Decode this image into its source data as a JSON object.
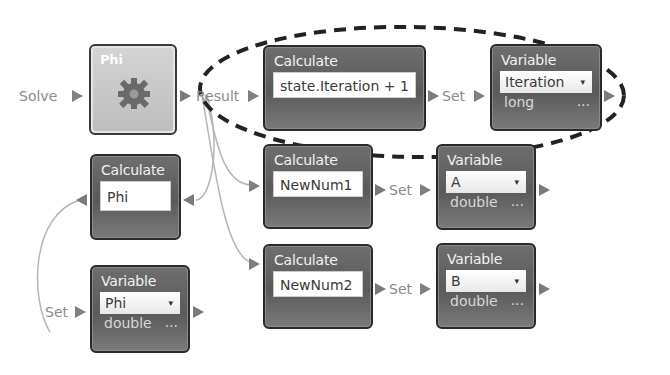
{
  "colors": {
    "node_bg": "#626262",
    "node_border": "#2a2a2a",
    "phi_bg": "#c8c8c8",
    "port": "#7a7a7a",
    "wire": "#b0b0b0",
    "highlight_dash": "#222222"
  },
  "ports": {
    "solve": "Solve",
    "result": "Result",
    "set_iteration": "Set",
    "set_a": "Set",
    "set_b": "Set",
    "set_phi": "Set"
  },
  "nodes": {
    "phi_function": {
      "title": "Phi",
      "icon": "gear-icon"
    },
    "calc_iteration": {
      "title": "Calculate",
      "expression": "state.Iteration + 1"
    },
    "var_iteration": {
      "title": "Variable",
      "selected": "Iteration",
      "type": "long",
      "more": "..."
    },
    "calc_phi": {
      "title": "Calculate",
      "expression": "Phi"
    },
    "calc_newnum1": {
      "title": "Calculate",
      "expression": "NewNum1"
    },
    "var_a": {
      "title": "Variable",
      "selected": "A",
      "type": "double",
      "more": "..."
    },
    "calc_newnum2": {
      "title": "Calculate",
      "expression": "NewNum2"
    },
    "var_b": {
      "title": "Variable",
      "selected": "B",
      "type": "double",
      "more": "..."
    },
    "var_phi": {
      "title": "Variable",
      "selected": "Phi",
      "type": "double",
      "more": "..."
    }
  },
  "caret": "▾"
}
